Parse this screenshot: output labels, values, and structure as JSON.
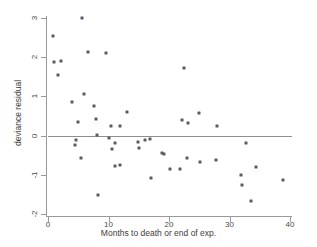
{
  "chart_data": {
    "type": "scatter",
    "title": "",
    "xlabel": "Months to death or end of exp.",
    "ylabel": "deviance residual",
    "xlim": [
      0,
      40
    ],
    "ylim": [
      -2,
      3
    ],
    "xticks": [
      0,
      10,
      20,
      30,
      40
    ],
    "xtick_labels": [
      "0",
      "10",
      "20",
      "30",
      "40"
    ],
    "yticks": [
      -2,
      -1,
      0,
      1,
      2,
      3
    ],
    "ytick_labels": [
      "-2",
      "-1",
      "0",
      "1",
      "2",
      "3"
    ],
    "grid": false,
    "legend": false,
    "reference_line": {
      "orientation": "horizontal",
      "y": 0,
      "color": "#8e8e8e"
    },
    "marker": {
      "shape": "square",
      "color": "#5a5a66",
      "size": 3
    },
    "series": [
      {
        "name": "deviance residual",
        "points": [
          [
            0.8,
            2.55
          ],
          [
            1.0,
            1.87
          ],
          [
            1.6,
            1.55
          ],
          [
            2.1,
            1.91
          ],
          [
            4.0,
            0.85
          ],
          [
            4.4,
            -0.25
          ],
          [
            4.6,
            -0.12
          ],
          [
            5.0,
            0.34
          ],
          [
            5.4,
            -0.58
          ],
          [
            5.7,
            3.01
          ],
          [
            6.0,
            1.06
          ],
          [
            6.6,
            2.14
          ],
          [
            7.6,
            0.75
          ],
          [
            8.0,
            0.43
          ],
          [
            8.1,
            0.02
          ],
          [
            8.2,
            -1.51
          ],
          [
            9.6,
            2.11
          ],
          [
            10.0,
            -0.07
          ],
          [
            10.4,
            0.25
          ],
          [
            10.6,
            -0.33
          ],
          [
            11.0,
            -0.19
          ],
          [
            11.1,
            -0.78
          ],
          [
            11.9,
            -0.75
          ],
          [
            11.9,
            0.25
          ],
          [
            13.0,
            0.61
          ],
          [
            14.8,
            -0.16
          ],
          [
            15.0,
            -0.31
          ],
          [
            16.0,
            -0.12
          ],
          [
            16.9,
            -0.09
          ],
          [
            17.0,
            -1.07
          ],
          [
            18.9,
            -0.44
          ],
          [
            19.1,
            -0.47
          ],
          [
            20.1,
            -0.85
          ],
          [
            21.9,
            -0.86
          ],
          [
            22.2,
            0.41
          ],
          [
            22.4,
            1.72
          ],
          [
            22.9,
            -0.56
          ],
          [
            23.2,
            0.31
          ],
          [
            25.0,
            0.58
          ],
          [
            25.1,
            -0.68
          ],
          [
            27.8,
            -0.62
          ],
          [
            27.9,
            0.24
          ],
          [
            31.9,
            -1.0
          ],
          [
            32.1,
            -1.26
          ],
          [
            32.8,
            -0.19
          ],
          [
            33.5,
            -1.66
          ],
          [
            34.4,
            -0.79
          ],
          [
            38.9,
            -1.14
          ]
        ]
      }
    ]
  }
}
